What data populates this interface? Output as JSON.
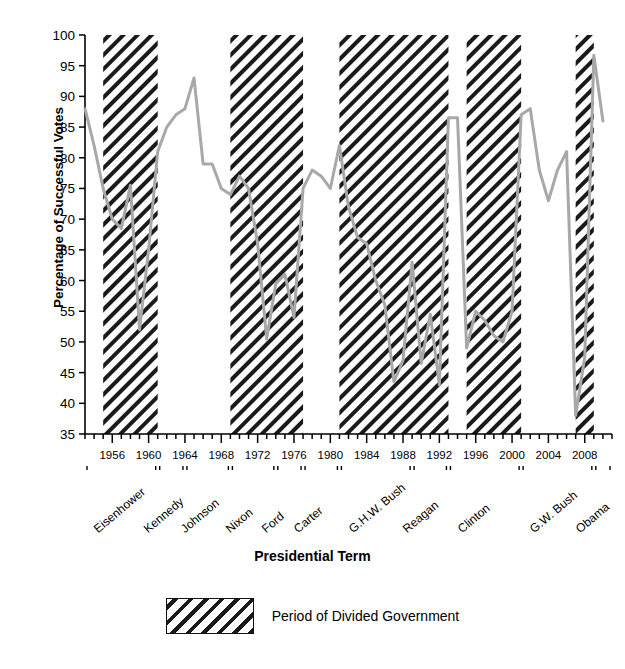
{
  "chart_data": {
    "type": "line",
    "title": "",
    "xlabel": "Presidential Term",
    "ylabel": "Percentage of Successful Votes",
    "ylim": [
      35,
      100
    ],
    "xlim": [
      1953,
      2011
    ],
    "ytick_values": [
      35,
      40,
      45,
      50,
      55,
      60,
      65,
      70,
      75,
      80,
      85,
      90,
      95,
      100
    ],
    "ytick_labels": [
      "35",
      "40",
      "45",
      "50",
      "55",
      "60",
      "65",
      "70",
      "75",
      "80",
      "85",
      "90",
      "95",
      "100"
    ],
    "xtick_values": [
      1956,
      1960,
      1964,
      1968,
      1972,
      1976,
      1980,
      1984,
      1988,
      1992,
      1996,
      2000,
      2004,
      2008
    ],
    "xtick_labels": [
      "1956",
      "1960",
      "1964",
      "1968",
      "1972",
      "1976",
      "1980",
      "1984",
      "1988",
      "1992",
      "1996",
      "2000",
      "2004",
      "2008"
    ],
    "xtick_minor_step": 1,
    "grid": false,
    "legend_position": "below-axes",
    "line_color": "#a8a8a8",
    "series": [
      {
        "name": "Percentage of Successful Votes",
        "x": [
          1953,
          1954,
          1955,
          1956,
          1957,
          1958,
          1959,
          1960,
          1961,
          1962,
          1963,
          1964,
          1965,
          1966,
          1967,
          1968,
          1969,
          1970,
          1971,
          1972,
          1973,
          1974,
          1975,
          1976,
          1977,
          1978,
          1979,
          1980,
          1981,
          1982,
          1983,
          1984,
          1985,
          1986,
          1987,
          1988,
          1989,
          1990,
          1991,
          1992,
          1993,
          1994,
          1995,
          1996,
          1997,
          1998,
          1999,
          2000,
          2001,
          2002,
          2003,
          2004,
          2005,
          2006,
          2007,
          2008,
          2009,
          2010
        ],
        "values": [
          88.0,
          82.0,
          75.0,
          70.0,
          68.5,
          75.5,
          52.0,
          65.0,
          81.0,
          85.0,
          87.0,
          88.0,
          93.0,
          79.0,
          79.0,
          75.0,
          74.0,
          77.0,
          75.0,
          66.0,
          50.5,
          59.5,
          61.0,
          54.0,
          75.0,
          78.0,
          77.0,
          75.0,
          82.0,
          72.0,
          67.0,
          66.0,
          60.0,
          56.0,
          43.5,
          47.0,
          63.0,
          46.5,
          54.5,
          43.0,
          86.5,
          86.5,
          49.0,
          55.0,
          53.5,
          51.0,
          50.0,
          55.0,
          87.0,
          88.0,
          78.0,
          73.0,
          78.0,
          81.0,
          38.0,
          47.5,
          96.7,
          86.0
        ]
      }
    ],
    "shaded_regions": {
      "label": "Period of Divided Government",
      "hatch": "/",
      "spans": [
        {
          "start": 1955,
          "end": 1961
        },
        {
          "start": 1969,
          "end": 1977
        },
        {
          "start": 1981,
          "end": 1993
        },
        {
          "start": 1995,
          "end": 2001
        },
        {
          "start": 2007,
          "end": 2009
        }
      ]
    },
    "presidential_terms": [
      {
        "name": "Eisenhower",
        "start": 1953,
        "end": 1961
      },
      {
        "name": "Kennedy",
        "start": 1961,
        "end": 1964
      },
      {
        "name": "Johnson",
        "start": 1964,
        "end": 1969
      },
      {
        "name": "Nixon",
        "start": 1969,
        "end": 1974
      },
      {
        "name": "Ford",
        "start": 1974,
        "end": 1977
      },
      {
        "name": "Carter",
        "start": 1977,
        "end": 1981
      },
      {
        "name": "G.H.W. Bush",
        "start": 1981,
        "end": 1989
      },
      {
        "name": "Reagan",
        "start": 1989,
        "end": 1993
      },
      {
        "name": "Clinton",
        "start": 1993,
        "end": 2001
      },
      {
        "name": "G.W. Bush",
        "start": 2001,
        "end": 2009
      },
      {
        "name": "Obama",
        "start": 2009,
        "end": 2011
      }
    ]
  },
  "legend": {
    "swatch_label": "Period of Divided Government"
  },
  "colors": {
    "line": "#a8a8a8",
    "hatch": "#1a1a1a",
    "axis": "#000000",
    "background": "#ffffff"
  }
}
